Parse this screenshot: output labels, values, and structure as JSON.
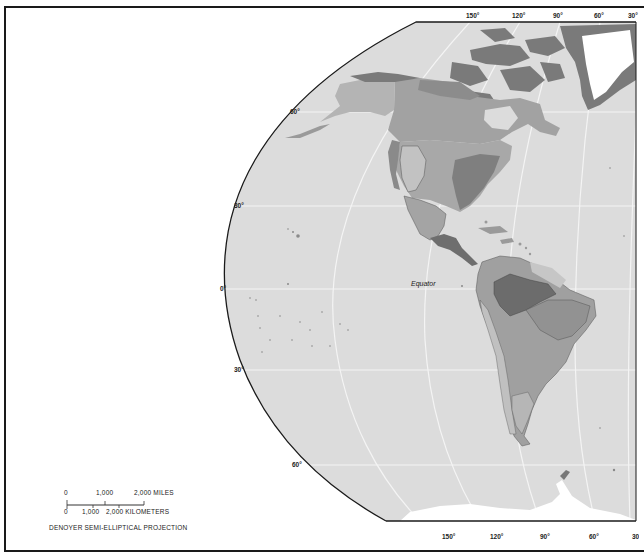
{
  "map": {
    "title": "Western Hemisphere vegetation/biome regions",
    "projection_label": "DENOYER SEMI-ELLIPTICAL PROJECTION",
    "equator_label": "Equator",
    "colors": {
      "ocean": "#dcdcdc",
      "land_light": "#b8b8b8",
      "land_medium": "#a2a2a2",
      "land_dark": "#8c8c8c",
      "land_darkest": "#6f6f6f",
      "ice": "#ffffff",
      "graticule": "#f4f4f4",
      "border": "#1a1a1a"
    },
    "top_longitude_labels": [
      "150°",
      "120°",
      "90°",
      "60°",
      "30°"
    ],
    "bottom_longitude_labels": [
      "150°",
      "120°",
      "90°",
      "60°",
      "30°"
    ],
    "left_latitude_labels": [
      "60°",
      "30°",
      "0°",
      "30°",
      "60°"
    ],
    "scale": {
      "miles_labels": [
        "0",
        "1,000",
        "2,000 MILES"
      ],
      "km_labels": [
        "0",
        "1,000",
        "2,000 KILOMETERS"
      ]
    },
    "regions": [
      "Greenland",
      "Canadian Arctic Archipelago",
      "Alaska",
      "Canada",
      "United States",
      "Mexico",
      "Central America",
      "Caribbean",
      "South America",
      "Antarctic Peninsula",
      "Pacific islands"
    ]
  }
}
